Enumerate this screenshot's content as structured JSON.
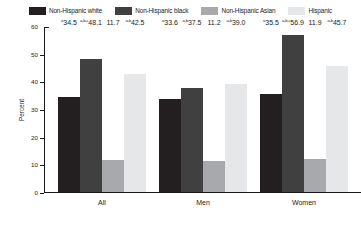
{
  "chart_data": {
    "type": "bar",
    "title": "",
    "xlabel": "",
    "ylabel": "Percent",
    "ylim": [
      0,
      60
    ],
    "yticks": [
      0,
      10,
      20,
      30,
      40,
      50,
      60
    ],
    "grid": false,
    "legend_position": "top-center",
    "categories": [
      "All",
      "Men",
      "Women"
    ],
    "series": [
      {
        "name": "Non-Hispanic white",
        "color": "#231f20",
        "values": [
          34.5,
          33.6,
          35.5
        ],
        "labels": [
          "34.5",
          "33.6",
          "35.5"
        ],
        "notes": [
          "a",
          "a",
          "a"
        ]
      },
      {
        "name": "Non-Hispanic black",
        "color": "#404040",
        "values": [
          48.1,
          37.5,
          56.9
        ],
        "labels": [
          "48.1",
          "37.5",
          "56.9"
        ],
        "notes": [
          "a,b,c",
          "a,b",
          "a,b,c"
        ]
      },
      {
        "name": "Non-Hispanic Asian",
        "color": "#a7a9ac",
        "values": [
          11.7,
          11.2,
          11.9
        ],
        "labels": [
          "11.7",
          "11.2",
          "11.9"
        ],
        "notes": [
          "",
          "",
          ""
        ]
      },
      {
        "name": "Hispanic",
        "color": "#e6e7e8",
        "values": [
          42.5,
          39.0,
          45.7
        ],
        "labels": [
          "42.5",
          "39.0",
          "45.7"
        ],
        "notes": [
          "a,b",
          "a,b",
          "a,b"
        ]
      }
    ]
  }
}
